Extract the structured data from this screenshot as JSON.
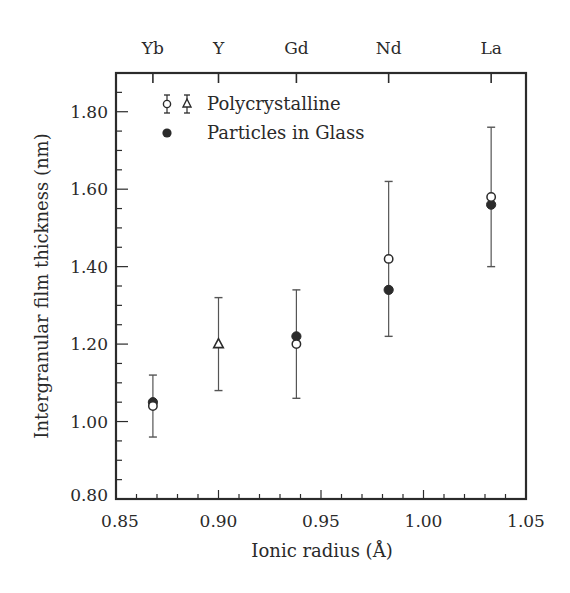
{
  "chart_data": {
    "type": "scatter",
    "title": "",
    "xlabel": "Ionic radius (Å)",
    "ylabel": "Intergranular film thickness (nm)",
    "xlim": [
      0.85,
      1.05
    ],
    "ylim": [
      0.8,
      1.9
    ],
    "x_ticks": [
      0.85,
      0.9,
      0.95,
      1.0,
      1.05
    ],
    "x_tick_labels": [
      "0.85",
      "0.90",
      "0.95",
      "1.00",
      "1.05"
    ],
    "x_minor_step": 0.01,
    "y_ticks": [
      0.8,
      1.0,
      1.2,
      1.4,
      1.6,
      1.8
    ],
    "y_tick_labels": [
      "0.80",
      "1.00",
      "1.20",
      "1.40",
      "1.60",
      "1.80"
    ],
    "y_minor_step": 0.05,
    "grid": false,
    "top_axis": {
      "labels": [
        "Yb",
        "Y",
        "Gd",
        "Nd",
        "La"
      ],
      "positions": [
        0.868,
        0.9,
        0.938,
        0.983,
        1.033
      ]
    },
    "legend": {
      "position": "upper left",
      "entries": [
        {
          "label": "Polycrystalline",
          "markers": [
            "open-circle-errorbar",
            "open-triangle-errorbar"
          ]
        },
        {
          "label": "Particles in Glass",
          "markers": [
            "filled-circle"
          ]
        }
      ]
    },
    "series": [
      {
        "name": "Polycrystalline",
        "points": [
          {
            "element": "Yb",
            "x": 0.868,
            "y": 1.04,
            "marker": "open-circle",
            "err_low": 0.96,
            "err_high": 1.12
          },
          {
            "element": "Y",
            "x": 0.9,
            "y": 1.2,
            "marker": "open-triangle",
            "err_low": 1.08,
            "err_high": 1.32
          },
          {
            "element": "Gd",
            "x": 0.938,
            "y": 1.2,
            "marker": "open-circle",
            "err_low": 1.06,
            "err_high": 1.34
          },
          {
            "element": "Nd",
            "x": 0.983,
            "y": 1.42,
            "marker": "open-circle",
            "err_low": 1.22,
            "err_high": 1.62
          },
          {
            "element": "La",
            "x": 1.033,
            "y": 1.58,
            "marker": "open-circle",
            "err_low": 1.4,
            "err_high": 1.76
          }
        ]
      },
      {
        "name": "Particles in Glass",
        "points": [
          {
            "element": "Yb",
            "x": 0.868,
            "y": 1.05,
            "marker": "filled-circle"
          },
          {
            "element": "Gd",
            "x": 0.938,
            "y": 1.22,
            "marker": "filled-circle"
          },
          {
            "element": "Nd",
            "x": 0.983,
            "y": 1.34,
            "marker": "filled-circle"
          },
          {
            "element": "La",
            "x": 1.033,
            "y": 1.56,
            "marker": "filled-circle"
          }
        ]
      }
    ],
    "colors": {
      "axis": "#2b2b2b",
      "marker": "#2b2b2b",
      "errorbar": "#555555",
      "background": "#ffffff"
    }
  }
}
